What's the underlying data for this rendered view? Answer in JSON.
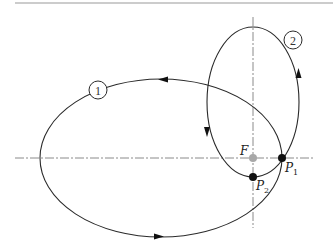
{
  "diagram": {
    "type": "orbit-transfer",
    "colors": {
      "line": "#2a2a2a",
      "axis": "#8a8a8a",
      "rule": "#9a9a9a",
      "focus": "#a8a8a8",
      "point": "#111111"
    },
    "labels": {
      "focus": "F",
      "p1_main": "P",
      "p1_sub": "1",
      "p2_main": "P",
      "p2_sub": "2",
      "orbit1": "1",
      "orbit2": "2"
    },
    "orbits": [
      {
        "id": "1",
        "direction": "counter-clockwise",
        "cx": 161,
        "cy": 158,
        "rx": 121,
        "ry": 79
      },
      {
        "id": "2",
        "direction": "clockwise",
        "cx": 253,
        "cy": 102,
        "rx": 46,
        "ry": 75
      }
    ],
    "points": [
      {
        "name": "F",
        "x": 253,
        "y": 158
      },
      {
        "name": "P1",
        "x": 282,
        "y": 158
      },
      {
        "name": "P2",
        "x": 253,
        "y": 177
      }
    ]
  }
}
